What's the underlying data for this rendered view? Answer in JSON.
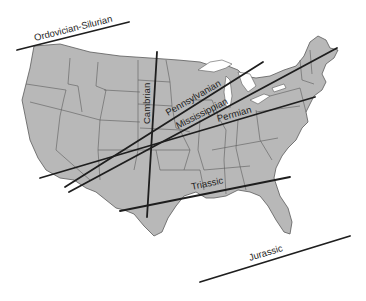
{
  "figure": {
    "type": "map",
    "region": "Contiguous United States",
    "colors": {
      "land": "#b8b8b8",
      "borders": "#5c5c5c",
      "lines": "#1e1e1e",
      "water": "#ffffff"
    }
  },
  "lines": [
    {
      "id": "ordovician-silurian",
      "label": "Ordovician-Silurian",
      "x1": 17,
      "y1": 50,
      "x2": 129,
      "y2": 22,
      "label_x": 35,
      "label_y": 41,
      "angle": -14
    },
    {
      "id": "cambrian",
      "label": "Cambrian",
      "x1": 157,
      "y1": 52,
      "x2": 147,
      "y2": 217,
      "label_x": 150,
      "label_y": 124,
      "angle": -90
    },
    {
      "id": "pennsylvanian",
      "label": "Pennsylvanian",
      "x1": 65,
      "y1": 187,
      "x2": 263,
      "y2": 62,
      "label_x": 168,
      "label_y": 116,
      "angle": -30
    },
    {
      "id": "mississippian",
      "label": "Mississippian",
      "x1": 69,
      "y1": 192,
      "x2": 337,
      "y2": 48,
      "label_x": 178,
      "label_y": 129,
      "angle": -27
    },
    {
      "id": "permian",
      "label": "Permian",
      "x1": 40,
      "y1": 178,
      "x2": 315,
      "y2": 97,
      "label_x": 218,
      "label_y": 122,
      "angle": -16
    },
    {
      "id": "triassic",
      "label": "Triassic",
      "x1": 120,
      "y1": 211,
      "x2": 290,
      "y2": 177,
      "label_x": 192,
      "label_y": 190,
      "angle": -12
    },
    {
      "id": "jurassic",
      "label": "Jurassic",
      "x1": 200,
      "y1": 282,
      "x2": 350,
      "y2": 236,
      "label_x": 250,
      "label_y": 261,
      "angle": -17
    }
  ]
}
